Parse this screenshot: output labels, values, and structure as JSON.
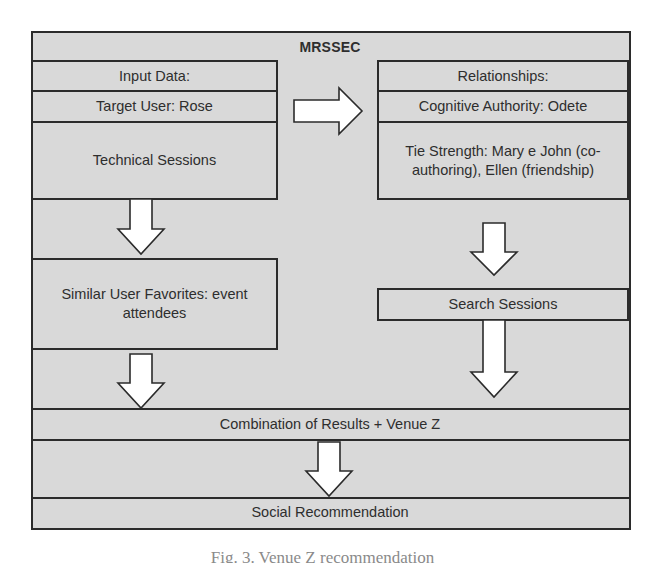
{
  "diagram": {
    "title": "MRSSEC",
    "input_panel": {
      "header": "Input Data:",
      "target_user": "Target User: Rose",
      "sessions": "Technical Sessions"
    },
    "relationships_panel": {
      "header": "Relationships:",
      "cognitive_authority": "Cognitive Authority: Odete",
      "tie_strength": "Tie Strength: Mary e John (co-authoring), Ellen (friendship)"
    },
    "similar_user_favorites": "Similar User Favorites: event attendees",
    "search_sessions": "Search Sessions",
    "combination": "Combination of Results + Venue Z",
    "output": "Social Recommendation",
    "arrows": [
      {
        "id": "input-to-relationships",
        "direction": "right"
      },
      {
        "id": "input-to-similar-favorites",
        "direction": "down"
      },
      {
        "id": "relationships-to-search-sessions",
        "direction": "down"
      },
      {
        "id": "similar-favorites-to-combination",
        "direction": "down"
      },
      {
        "id": "search-sessions-to-combination",
        "direction": "down"
      },
      {
        "id": "combination-to-social-recommendation",
        "direction": "down"
      }
    ],
    "colors": {
      "fill": "#d9d9d9",
      "border": "#2b2b2b",
      "arrow_fill": "#ffffff",
      "text": "#2e2e2e"
    }
  },
  "caption": "Fig. 3. Venue Z recommendation"
}
